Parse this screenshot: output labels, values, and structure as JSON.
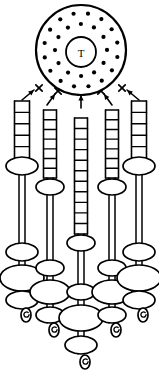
{
  "figure": {
    "background_color": "#ffffff",
    "stroke_color": "#000000",
    "width": 159,
    "height": 384
  },
  "disc": {
    "name": "dotted-disc",
    "center_x": 81,
    "center_y": 50,
    "radius_x": 45,
    "radius_y": 45,
    "stroke_width": 2.2,
    "core": {
      "label": "T",
      "center_x": 81,
      "center_y": 52,
      "radius": 15,
      "stroke_width": 1.8
    },
    "dot_radius": 2.1,
    "outer_ring": {
      "radius": 37,
      "count": 16
    },
    "middle_ring": {
      "radius": 26,
      "count": 12
    },
    "inner_ring": {
      "radius": 0,
      "count": 0
    }
  },
  "arrows": {
    "name": "upward-arrows",
    "count": 5,
    "stroke_width": 1.6,
    "items": [
      {
        "x1": 22,
        "y1": 100,
        "x2": 34,
        "y2": 90,
        "mark_x": 39,
        "mark_y": 88
      },
      {
        "x1": 47,
        "y1": 105,
        "x2": 55,
        "y2": 94,
        "mark_x": 58,
        "mark_y": 91
      },
      {
        "x1": 81,
        "y1": 108,
        "x2": 81,
        "y2": 95,
        "mark_x": 81,
        "mark_y": 92
      },
      {
        "x1": 112,
        "y1": 105,
        "x2": 104,
        "y2": 94,
        "mark_x": 101,
        "mark_y": 91
      },
      {
        "x1": 139,
        "y1": 100,
        "x2": 127,
        "y2": 90,
        "mark_x": 122,
        "mark_y": 88
      }
    ]
  },
  "strands": {
    "name": "hanging-strands",
    "count": 5,
    "items": [
      {
        "id": "strand-1-left-outer",
        "x": 22,
        "ladder": {
          "top": 101,
          "bottom": 158,
          "rungs": 5,
          "width": 15
        },
        "beads": [
          {
            "cy": 166,
            "rx": 16,
            "ry": 9
          },
          {
            "cy": 252,
            "rx": 16,
            "ry": 9
          },
          {
            "cy": 278,
            "rx": 22,
            "ry": 13
          },
          {
            "cy": 300,
            "rx": 16,
            "ry": 9
          }
        ],
        "hook": {
          "cx": 26,
          "cy": 315,
          "rx": 5,
          "ry": 7
        },
        "stem_bottom": 308
      },
      {
        "id": "strand-2-left-inner",
        "x": 50,
        "ladder": {
          "top": 110,
          "bottom": 178,
          "rungs": 7,
          "width": 13
        },
        "beads": [
          {
            "cy": 187,
            "rx": 14,
            "ry": 8
          },
          {
            "cy": 268,
            "rx": 14,
            "ry": 8
          },
          {
            "cy": 292,
            "rx": 20,
            "ry": 12
          },
          {
            "cy": 315,
            "rx": 14,
            "ry": 8
          }
        ],
        "hook": {
          "cx": 54,
          "cy": 330,
          "rx": 5,
          "ry": 7
        },
        "stem_bottom": 323
      },
      {
        "id": "strand-3-center",
        "x": 81,
        "ladder": {
          "top": 118,
          "bottom": 234,
          "rungs": 11,
          "width": 13
        },
        "beads": [
          {
            "cy": 243,
            "rx": 14,
            "ry": 8
          },
          {
            "cy": 292,
            "rx": 14,
            "ry": 8
          },
          {
            "cy": 318,
            "rx": 22,
            "ry": 13
          },
          {
            "cy": 345,
            "rx": 16,
            "ry": 9
          }
        ],
        "hook": {
          "cx": 85,
          "cy": 362,
          "rx": 5,
          "ry": 7
        },
        "stem_bottom": 354
      },
      {
        "id": "strand-4-right-inner",
        "x": 112,
        "ladder": {
          "top": 110,
          "bottom": 178,
          "rungs": 7,
          "width": 13
        },
        "beads": [
          {
            "cy": 187,
            "rx": 14,
            "ry": 8
          },
          {
            "cy": 268,
            "rx": 14,
            "ry": 8
          },
          {
            "cy": 292,
            "rx": 20,
            "ry": 12
          },
          {
            "cy": 315,
            "rx": 14,
            "ry": 8
          }
        ],
        "hook": {
          "cx": 116,
          "cy": 330,
          "rx": 5,
          "ry": 7
        },
        "stem_bottom": 323
      },
      {
        "id": "strand-5-right-outer",
        "x": 139,
        "ladder": {
          "top": 101,
          "bottom": 158,
          "rungs": 5,
          "width": 15
        },
        "beads": [
          {
            "cy": 166,
            "rx": 16,
            "ry": 9
          },
          {
            "cy": 252,
            "rx": 16,
            "ry": 9
          },
          {
            "cy": 278,
            "rx": 22,
            "ry": 13
          },
          {
            "cy": 300,
            "rx": 16,
            "ry": 9
          }
        ],
        "hook": {
          "cx": 143,
          "cy": 315,
          "rx": 5,
          "ry": 7
        },
        "stem_bottom": 308
      }
    ]
  }
}
